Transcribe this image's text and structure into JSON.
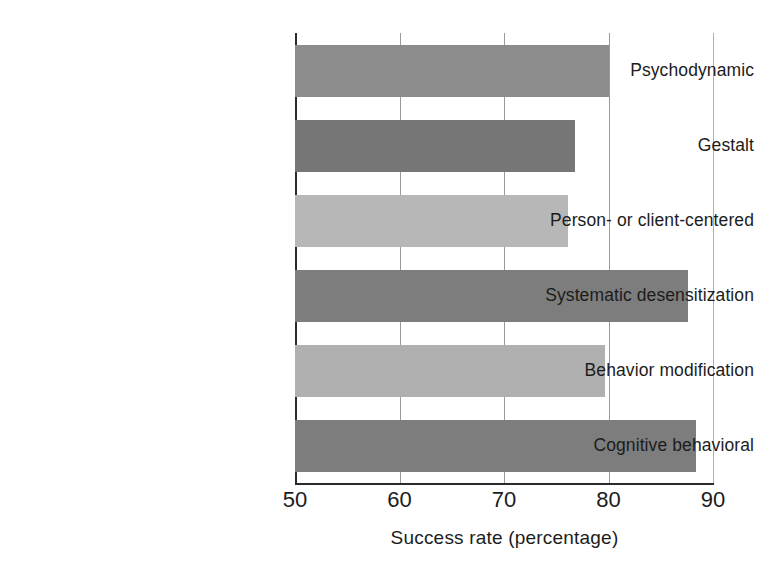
{
  "chart_data": {
    "type": "bar",
    "orientation": "horizontal",
    "title": "",
    "subtitle": "",
    "xlabel": "Success rate (percentage)",
    "ylabel": "",
    "xlim": [
      50,
      90
    ],
    "xticks": [
      50,
      60,
      70,
      80,
      90
    ],
    "xtick_labels": [
      "50",
      "60",
      "70",
      "80",
      "90"
    ],
    "grid": "vertical",
    "legend": "none",
    "categories": [
      "Psychodynamic",
      "Gestalt",
      "Person- or client-centered",
      "Systematic desensitization",
      "Behavior modification",
      "Cognitive behavioral"
    ],
    "values": [
      80.0,
      76.8,
      76.1,
      87.6,
      79.7,
      88.4
    ],
    "bar_colors": [
      "#8c8c8c",
      "#767676",
      "#b7b7b7",
      "#7d7d7d",
      "#b0b0b0",
      "#7d7d7d"
    ],
    "annotations": []
  },
  "axis": {
    "title": "Success rate (percentage)",
    "ticks": [
      {
        "label": "50",
        "value": 50
      },
      {
        "label": "60",
        "value": 60
      },
      {
        "label": "70",
        "value": 70
      },
      {
        "label": "80",
        "value": 80
      },
      {
        "label": "90",
        "value": 90
      }
    ]
  },
  "colors": {
    "background": "#ffffff",
    "axis": "#2b2b2b",
    "gridline": "#9a9a9a",
    "text": "#1c1c1c",
    "bar_dark": "#767676",
    "bar_medium": "#8c8c8c",
    "bar_light": "#b7b7b7"
  }
}
